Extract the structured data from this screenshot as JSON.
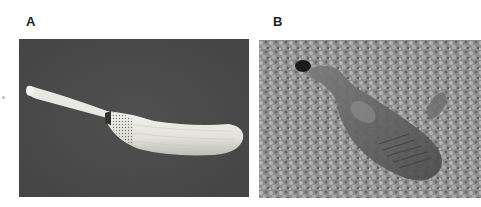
{
  "figure": {
    "panels": [
      {
        "label": "A",
        "description": "Pale elongated animal with slender proboscis-like anterior and swollen papillate body on dark background"
      },
      {
        "label": "B",
        "description": "Dark translucent animal on coarse sandy/gravel substrate"
      }
    ]
  },
  "colors": {
    "panel_a_background": "#4a4a4a",
    "panel_a_specimen": "#e6e6e0",
    "panel_b_substrate": "#8a8a8a",
    "panel_b_specimen": "#5a5a5a"
  }
}
